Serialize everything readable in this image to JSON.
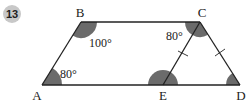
{
  "problem_number": "13",
  "points": {
    "A": {
      "label": "A",
      "x": 42,
      "y": 85
    },
    "B": {
      "label": "B",
      "x": 81,
      "y": 22
    },
    "C": {
      "label": "C",
      "x": 200,
      "y": 22
    },
    "D": {
      "label": "D",
      "x": 240,
      "y": 85
    },
    "E": {
      "label": "E",
      "x": 163,
      "y": 85
    }
  },
  "angles": {
    "B": "100°",
    "A": "80°",
    "C": "80°"
  },
  "colors": {
    "stroke": "#222222",
    "fill": "#6b6b6b",
    "badge": "#c8c8c8"
  }
}
